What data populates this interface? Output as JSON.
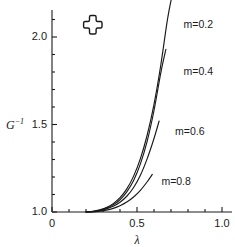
{
  "figure": {
    "background_color": "#ffffff",
    "line_color": "#1a1a1a",
    "width": 235,
    "height": 247
  },
  "axes": {
    "y_title_base": "G",
    "y_title_exponent": "−1",
    "x_title": "λ",
    "y_ticks": [
      "1.0",
      "1.5",
      "2.0"
    ],
    "x_ticks": [
      "0",
      "0.5",
      "1.0"
    ]
  },
  "marker": {
    "name": "cross-outline-marker",
    "x_value": 0.24,
    "y_value": 2.07
  },
  "chart_data": {
    "type": "line",
    "title": "",
    "xlabel": "λ",
    "ylabel": "G⁻¹",
    "xlim": [
      0,
      1.05
    ],
    "ylim": [
      1.0,
      2.25
    ],
    "xticks": [
      0,
      0.5,
      1.0
    ],
    "xtick_labels": [
      "0",
      "0.5",
      "1.0"
    ],
    "yticks": [
      1.0,
      1.5,
      2.0
    ],
    "ytick_labels": [
      "1.0",
      "1.5",
      "2.0"
    ],
    "minor_ticks_per_interval": 5,
    "grid": false,
    "legend": "inline-curve-labels",
    "annotations": [
      {
        "text": "m=0.2",
        "x": 0.75,
        "y": 2.07
      },
      {
        "text": "m=0.4",
        "x": 0.75,
        "y": 1.8
      },
      {
        "text": "m=0.6",
        "x": 0.7,
        "y": 1.46
      },
      {
        "text": "m=0.8",
        "x": 0.62,
        "y": 1.17
      }
    ],
    "series": [
      {
        "name": "m=0.2",
        "label": "m=0.2",
        "x": [
          0.2,
          0.24,
          0.28,
          0.32,
          0.36,
          0.4,
          0.44,
          0.48,
          0.52,
          0.56,
          0.6,
          0.64,
          0.68,
          0.71
        ],
        "y": [
          1.0,
          1.004,
          1.012,
          1.026,
          1.048,
          1.082,
          1.132,
          1.205,
          1.305,
          1.44,
          1.615,
          1.84,
          2.105,
          2.255
        ]
      },
      {
        "name": "m=0.4",
        "label": "m=0.4",
        "x": [
          0.2,
          0.24,
          0.28,
          0.32,
          0.36,
          0.4,
          0.44,
          0.48,
          0.52,
          0.56,
          0.6,
          0.64,
          0.67
        ],
        "y": [
          1.0,
          1.003,
          1.01,
          1.022,
          1.041,
          1.07,
          1.115,
          1.18,
          1.275,
          1.405,
          1.58,
          1.795,
          1.93
        ]
      },
      {
        "name": "m=0.6",
        "label": "m=0.6",
        "x": [
          0.2,
          0.24,
          0.28,
          0.32,
          0.36,
          0.4,
          0.44,
          0.48,
          0.52,
          0.56,
          0.6,
          0.63
        ],
        "y": [
          1.0,
          1.002,
          1.008,
          1.018,
          1.033,
          1.056,
          1.09,
          1.14,
          1.21,
          1.305,
          1.42,
          1.52
        ]
      },
      {
        "name": "m=0.8",
        "label": "m=0.8",
        "x": [
          0.2,
          0.24,
          0.28,
          0.32,
          0.36,
          0.4,
          0.44,
          0.48,
          0.52,
          0.56,
          0.59
        ],
        "y": [
          1.0,
          1.001,
          1.005,
          1.011,
          1.021,
          1.036,
          1.057,
          1.086,
          1.124,
          1.173,
          1.215
        ]
      }
    ]
  }
}
